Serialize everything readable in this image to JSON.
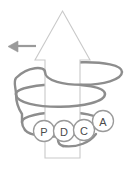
{
  "diagram": {
    "title_fragment": "",
    "background_color": "#ffffff",
    "arrow": {
      "name": "upward-improvement-arrow",
      "direction": "up",
      "fill_color": "#ffffff",
      "stroke_color": "#c9c9c9"
    },
    "left_arrow": {
      "name": "left-pointing-arrow",
      "direction": "left",
      "fill_color": "#9a9a9a",
      "stroke_color": "#9a9a9a"
    },
    "spiral": {
      "name": "ascending-spiral",
      "stroke_color": "#8d8d8d",
      "loops": 3
    },
    "cycle_steps": [
      {
        "letter": "P",
        "cx": 44,
        "cy": 131,
        "r": 10.5
      },
      {
        "letter": "D",
        "cx": 64,
        "cy": 131,
        "r": 10.5
      },
      {
        "letter": "C",
        "cx": 84,
        "cy": 130,
        "r": 10.5
      },
      {
        "letter": "A",
        "cx": 103,
        "cy": 121,
        "r": 10.5
      }
    ],
    "circle_stroke_color": "#9a9a9a",
    "circle_fill_color": "#ffffff",
    "letter_color": "#4a4a4a"
  }
}
